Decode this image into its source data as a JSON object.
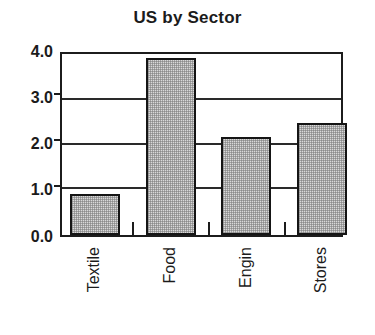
{
  "chart_data": {
    "type": "bar",
    "title": "US by Sector",
    "xlabel": "",
    "ylabel": "",
    "categories": [
      "Textile",
      "Food",
      "Engin",
      "Stores"
    ],
    "values": [
      0.93,
      4.0,
      2.22,
      2.54
    ],
    "ylim": [
      0.0,
      4.0
    ],
    "yticks": [
      "0.0",
      "1.0",
      "2.0",
      "3.0",
      "4.0"
    ],
    "ytick_values": [
      0.0,
      1.0,
      2.0,
      3.0,
      4.0
    ],
    "grid": true,
    "legend": "none",
    "bar_fill_color": "#d9d9d9",
    "bar_edge_color": "#151515",
    "axis_color": "#1c1c1c",
    "background_color": "#ffffff",
    "series": [
      {
        "name": "US by Sector",
        "values": [
          0.93,
          4.0,
          2.22,
          2.54
        ]
      }
    ]
  },
  "chart": {
    "title": "US by Sector",
    "yaxis": {
      "ticks": [
        {
          "label": "4.0",
          "value": 4.0
        },
        {
          "label": "3.0",
          "value": 3.0
        },
        {
          "label": "2.0",
          "value": 2.0
        },
        {
          "label": "1.0",
          "value": 1.0
        },
        {
          "label": "0.0",
          "value": 0.0
        }
      ]
    },
    "xaxis": {
      "categories": [
        {
          "label": "Textile",
          "value": 0.93
        },
        {
          "label": "Food",
          "value": 4.0
        },
        {
          "label": "Engin",
          "value": 2.22
        },
        {
          "label": "Stores",
          "value": 2.54
        }
      ]
    }
  }
}
